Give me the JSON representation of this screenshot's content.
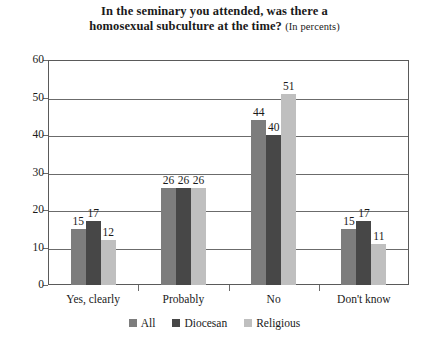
{
  "chart_data": {
    "type": "bar",
    "title": "In the seminary you attended, was there a homosexual subculture at the time?",
    "title_line1": "In the seminary you attended, was there a",
    "title_line2": "homosexual subculture at the time?",
    "subtitle": "(In percents)",
    "xlabel": "",
    "ylabel": "",
    "ylim": [
      0,
      60
    ],
    "ytick_step": 10,
    "yticks": [
      0,
      10,
      20,
      30,
      40,
      50,
      60
    ],
    "grid": true,
    "legend_position": "bottom",
    "categories": [
      "Yes, clearly",
      "Probably",
      "No",
      "Don't know"
    ],
    "series": [
      {
        "name": "All",
        "color": "#7d7d7d",
        "values": [
          15,
          26,
          44,
          15
        ]
      },
      {
        "name": "Diocesan",
        "color": "#474747",
        "values": [
          17,
          26,
          40,
          17
        ]
      },
      {
        "name": "Religious",
        "color": "#bfbfbf",
        "values": [
          12,
          26,
          51,
          11
        ]
      }
    ]
  }
}
